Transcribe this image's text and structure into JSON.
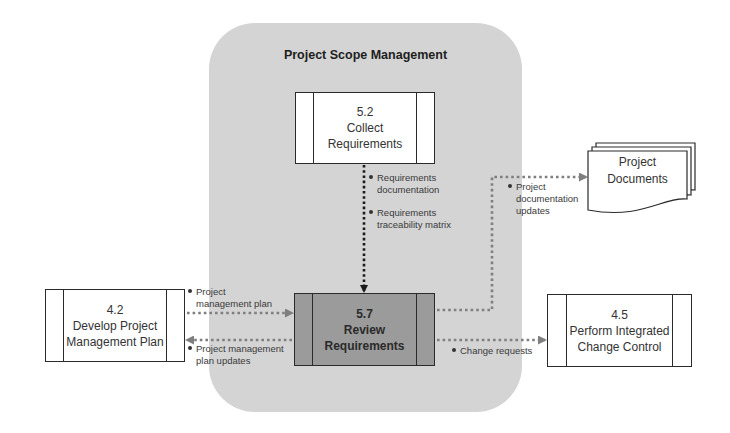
{
  "diagram": {
    "group_title": "Project Scope Management",
    "processes": [
      {
        "id": "5.2",
        "number": "5.2",
        "line1": "Collect",
        "line2": "Requirements"
      },
      {
        "id": "5.7",
        "number": "5.7",
        "line1": "Review",
        "line2": "Requirements"
      },
      {
        "id": "4.2",
        "number": "4.2",
        "line1": "Develop Project",
        "line2": "Management Plan"
      },
      {
        "id": "4.5",
        "number": "4.5",
        "line1": "Perform Integrated",
        "line2": "Change Control"
      }
    ],
    "document": {
      "line1": "Project",
      "line2": "Documents"
    },
    "flows": {
      "req_docs": {
        "l1": "Requirements",
        "l2": "documentation"
      },
      "req_matrix": {
        "l1": "Requirements",
        "l2": "traceability matrix"
      },
      "pm_plan": {
        "l1": "Project",
        "l2": "management plan"
      },
      "pm_plan_updates": {
        "l1": "Project management",
        "l2": "plan updates"
      },
      "change_requests": {
        "l1": "Change requests"
      },
      "doc_updates": {
        "l1": "Project",
        "l2": "documentation",
        "l3": "updates"
      }
    },
    "colors": {
      "panel": "#d4d4d4",
      "focus_process": "#9b9b9b",
      "input_arrow": "#1a1a1a",
      "output_arrow": "#7f7f7f"
    }
  }
}
